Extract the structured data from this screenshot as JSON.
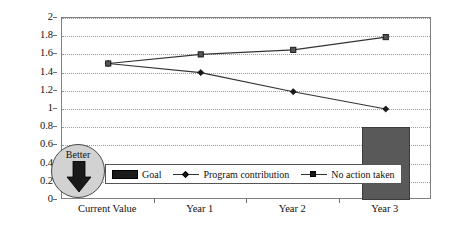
{
  "chart_data": {
    "type": "line",
    "title": "",
    "xlabel": "",
    "ylabel": "",
    "categories": [
      "Current Value",
      "Year 1",
      "Year 2",
      "Year 3"
    ],
    "ylim": [
      0,
      2
    ],
    "ytick_step": 0.2,
    "yticks": [
      "2",
      "1.8",
      "1.6",
      "1.4",
      "1.2",
      "1",
      "0.8",
      "0.6",
      "0.4",
      "0.2",
      "0"
    ],
    "grid": true,
    "legend_position": "bottom-center",
    "series": [
      {
        "name": "Goal",
        "type": "bar",
        "color": "#595959",
        "marker": "none",
        "values": [
          null,
          null,
          null,
          0.8
        ]
      },
      {
        "name": "Program contribution",
        "type": "line",
        "color": "#333333",
        "marker": "diamond",
        "values": [
          1.5,
          1.4,
          1.19,
          1.0
        ]
      },
      {
        "name": "No action taken",
        "type": "line",
        "color": "#333333",
        "marker": "square",
        "values": [
          1.5,
          1.6,
          1.65,
          1.79
        ]
      }
    ],
    "annotations": [
      {
        "name": "better-indicator",
        "label": "Better",
        "direction": "down",
        "shape": "circle",
        "fill": "#d2d2d2",
        "stroke": "#4a4a4a"
      }
    ]
  },
  "legend": {
    "items": [
      {
        "label": "Goal",
        "swatch": "bar-swatch"
      },
      {
        "label": "Program contribution",
        "swatch": "diamond-line-swatch"
      },
      {
        "label": "No action taken",
        "swatch": "square-line-swatch"
      }
    ]
  },
  "better_badge": {
    "label": "Better"
  },
  "colors": {
    "goal_bar": "#595959",
    "line": "#333333",
    "gridline": "#9a9a9a",
    "axis": "#808080",
    "badge_fill": "#d2d2d2",
    "badge_stroke": "#4a4a4a"
  }
}
